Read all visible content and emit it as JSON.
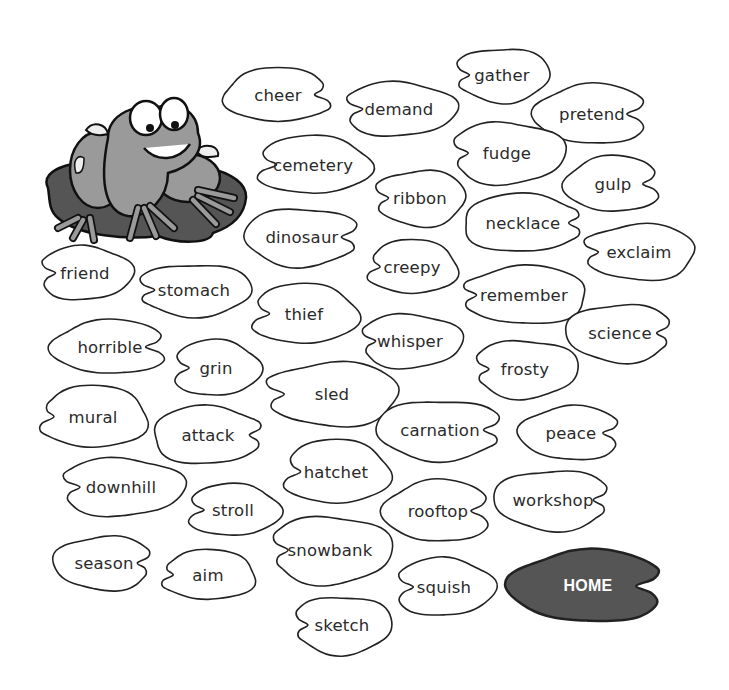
{
  "game": {
    "home_label": "HOME",
    "mascot": "frog-on-lily-pad",
    "colors": {
      "pad_stroke": "#222222",
      "pad_fill": "#ffffff",
      "home_fill": "#555555",
      "frog_body": "#9a9a9a",
      "lily_pad": "#555555"
    }
  },
  "pads": [
    {
      "word": "cheer",
      "x": 222,
      "y": 66,
      "w": 112,
      "h": 58,
      "notch": "right"
    },
    {
      "word": "demand",
      "x": 340,
      "y": 80,
      "w": 118,
      "h": 58,
      "notch": "left"
    },
    {
      "word": "gather",
      "x": 452,
      "y": 46,
      "w": 100,
      "h": 58,
      "notch": "left"
    },
    {
      "word": "pretend",
      "x": 533,
      "y": 82,
      "w": 118,
      "h": 64,
      "notch": "right"
    },
    {
      "word": "cemetery",
      "x": 253,
      "y": 134,
      "w": 120,
      "h": 62,
      "notch": "left"
    },
    {
      "word": "fudge",
      "x": 447,
      "y": 120,
      "w": 120,
      "h": 66,
      "notch": "left"
    },
    {
      "word": "ribbon",
      "x": 372,
      "y": 168,
      "w": 96,
      "h": 60,
      "notch": "left"
    },
    {
      "word": "gulp",
      "x": 563,
      "y": 154,
      "w": 100,
      "h": 60,
      "notch": "right"
    },
    {
      "word": "necklace",
      "x": 460,
      "y": 192,
      "w": 126,
      "h": 62,
      "notch": "right"
    },
    {
      "word": "dinosaur",
      "x": 242,
      "y": 206,
      "w": 120,
      "h": 62,
      "notch": "right"
    },
    {
      "word": "exclaim",
      "x": 580,
      "y": 222,
      "w": 118,
      "h": 60,
      "notch": "left"
    },
    {
      "word": "creepy",
      "x": 364,
      "y": 238,
      "w": 96,
      "h": 58,
      "notch": "left"
    },
    {
      "word": "friend",
      "x": 36,
      "y": 244,
      "w": 98,
      "h": 58,
      "notch": "left"
    },
    {
      "word": "stomach",
      "x": 134,
      "y": 262,
      "w": 120,
      "h": 56,
      "notch": "left"
    },
    {
      "word": "remember",
      "x": 458,
      "y": 264,
      "w": 132,
      "h": 62,
      "notch": "left"
    },
    {
      "word": "thief",
      "x": 248,
      "y": 282,
      "w": 112,
      "h": 64,
      "notch": "left"
    },
    {
      "word": "whisper",
      "x": 356,
      "y": 312,
      "w": 108,
      "h": 58,
      "notch": "left"
    },
    {
      "word": "science",
      "x": 564,
      "y": 302,
      "w": 112,
      "h": 62,
      "notch": "right"
    },
    {
      "word": "horrible",
      "x": 50,
      "y": 318,
      "w": 120,
      "h": 58,
      "notch": "right"
    },
    {
      "word": "grin",
      "x": 170,
      "y": 338,
      "w": 92,
      "h": 60,
      "notch": "left"
    },
    {
      "word": "frosty",
      "x": 470,
      "y": 338,
      "w": 110,
      "h": 62,
      "notch": "left"
    },
    {
      "word": "sled",
      "x": 262,
      "y": 360,
      "w": 140,
      "h": 68,
      "notch": "left"
    },
    {
      "word": "mural",
      "x": 36,
      "y": 384,
      "w": 114,
      "h": 66,
      "notch": "left"
    },
    {
      "word": "attack",
      "x": 150,
      "y": 404,
      "w": 116,
      "h": 62,
      "notch": "right"
    },
    {
      "word": "carnation",
      "x": 374,
      "y": 398,
      "w": 132,
      "h": 64,
      "notch": "right"
    },
    {
      "word": "peace",
      "x": 518,
      "y": 404,
      "w": 106,
      "h": 58,
      "notch": "right"
    },
    {
      "word": "hatchet",
      "x": 280,
      "y": 438,
      "w": 112,
      "h": 68,
      "notch": "left"
    },
    {
      "word": "downhill",
      "x": 56,
      "y": 456,
      "w": 130,
      "h": 62,
      "notch": "left"
    },
    {
      "word": "workshop",
      "x": 492,
      "y": 468,
      "w": 122,
      "h": 64,
      "notch": "right"
    },
    {
      "word": "rooftop",
      "x": 382,
      "y": 478,
      "w": 112,
      "h": 66,
      "notch": "right"
    },
    {
      "word": "stroll",
      "x": 184,
      "y": 482,
      "w": 98,
      "h": 56,
      "notch": "left"
    },
    {
      "word": "snowbank",
      "x": 266,
      "y": 514,
      "w": 128,
      "h": 72,
      "notch": "left"
    },
    {
      "word": "season",
      "x": 52,
      "y": 534,
      "w": 104,
      "h": 58,
      "notch": "right"
    },
    {
      "word": "aim",
      "x": 158,
      "y": 548,
      "w": 100,
      "h": 54,
      "notch": "left"
    },
    {
      "word": "squish",
      "x": 392,
      "y": 556,
      "w": 104,
      "h": 62,
      "notch": "left"
    },
    {
      "word": "sketch",
      "x": 290,
      "y": 594,
      "w": 104,
      "h": 62,
      "notch": "left"
    }
  ],
  "home_pad": {
    "x": 508,
    "y": 548,
    "w": 160,
    "h": 76
  }
}
